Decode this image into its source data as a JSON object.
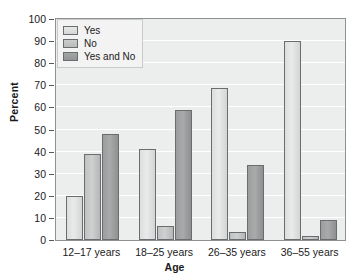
{
  "chart_data": {
    "type": "bar",
    "title": "",
    "xlabel": "Age",
    "ylabel": "Percent",
    "categories": [
      "12–17 years",
      "18–25 years",
      "26–35 years",
      "36–55 years"
    ],
    "series": [
      {
        "name": "Yes",
        "values": [
          20,
          41,
          69,
          90
        ]
      },
      {
        "name": "No",
        "values": [
          39,
          6.5,
          3.5,
          2
        ]
      },
      {
        "name": "Yes and No",
        "values": [
          48,
          59,
          34,
          9
        ]
      }
    ],
    "ylim": [
      0,
      100
    ],
    "yticks": [
      0,
      10,
      20,
      30,
      40,
      50,
      60,
      70,
      80,
      90,
      100
    ],
    "ytick_labels": [
      "0",
      "10",
      "20",
      "30",
      "40",
      "50",
      "60",
      "70",
      "80",
      "90",
      "100"
    ],
    "grid": true,
    "legend_position": "top-left",
    "colors": {
      "Yes": "#e0e1e1",
      "No": "#c4c6c6",
      "Yes and No": "#9ea0a1",
      "plot_background": "#eceded",
      "gridline": "#ffffff",
      "axis": "#8e9192",
      "bar_outline": "#6a6d6f",
      "text": "#1a1a1a"
    }
  }
}
